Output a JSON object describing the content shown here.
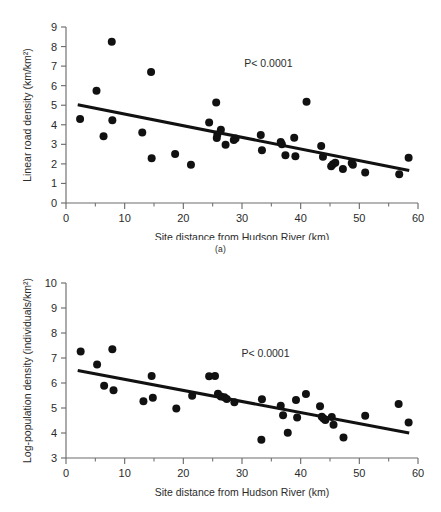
{
  "figure": {
    "panel_a_caption": "(a)",
    "background": "#ffffff",
    "marker_color": "#111111",
    "line_color": "#111111",
    "axis_color": "#6d6d6d"
  },
  "chart_data": [
    {
      "type": "scatter",
      "id": "panel-a",
      "title": "",
      "xlabel": "Site distance from Hudson River (km)",
      "ylabel": "Linear road density (km/km²)",
      "xlim": [
        0,
        60
      ],
      "ylim": [
        0,
        9
      ],
      "xticks": [
        0,
        10,
        20,
        30,
        40,
        50,
        60
      ],
      "xticklabels": [
        "0",
        "10",
        "20",
        "30",
        "40",
        "50",
        "60"
      ],
      "xminorticks": [
        5,
        15,
        25,
        35,
        45,
        55
      ],
      "yticks": [
        0,
        1,
        2,
        3,
        4,
        5,
        6,
        7,
        8,
        9
      ],
      "yticklabels": [
        "0",
        "1",
        "2",
        "3",
        "4",
        "5",
        "6",
        "7",
        "8",
        "9"
      ],
      "grid": false,
      "legend": null,
      "annotations": [
        {
          "text": "P< 0.0001",
          "x": 34.5,
          "y": 6.95
        }
      ],
      "trendline": {
        "x": [
          2.0,
          58.5
        ],
        "y": [
          5.02,
          1.66
        ]
      },
      "x": [
        2.4,
        5.2,
        6.4,
        7.8,
        7.9,
        13.0,
        14.5,
        14.6,
        18.6,
        21.3,
        24.4,
        25.6,
        25.7,
        25.8,
        26.4,
        27.2,
        28.6,
        28.9,
        33.2,
        33.4,
        36.6,
        36.8,
        37.4,
        38.9,
        39.1,
        41.0,
        43.5,
        43.8,
        45.2,
        45.5,
        45.9,
        47.2,
        48.7,
        48.9,
        51.0,
        56.8,
        58.4
      ],
      "y": [
        4.29,
        5.74,
        3.41,
        8.25,
        4.23,
        3.61,
        6.7,
        2.29,
        2.51,
        1.95,
        4.12,
        5.14,
        3.33,
        3.5,
        3.75,
        2.98,
        3.22,
        3.3,
        3.48,
        2.7,
        3.12,
        3.0,
        2.44,
        3.34,
        2.39,
        5.18,
        2.91,
        2.36,
        1.88,
        1.98,
        2.06,
        1.74,
        2.05,
        1.95,
        1.56,
        1.47,
        2.31
      ]
    },
    {
      "type": "scatter",
      "id": "panel-b",
      "title": "",
      "xlabel": "Site distance from Hudson River (km)",
      "ylabel": "Log-population density (individuals/km²)",
      "xlim": [
        0,
        60
      ],
      "ylim": [
        3,
        10
      ],
      "xticks": [
        0,
        10,
        20,
        30,
        40,
        50,
        60
      ],
      "xticklabels": [
        "0",
        "10",
        "20",
        "30",
        "40",
        "50",
        "60"
      ],
      "xminorticks": [
        5,
        15,
        25,
        35,
        45,
        55
      ],
      "yticks": [
        3,
        4,
        5,
        6,
        7,
        8,
        9,
        10
      ],
      "yticklabels": [
        "3",
        "4",
        "5",
        "6",
        "7",
        "8",
        "9",
        "10"
      ],
      "grid": false,
      "legend": null,
      "annotations": [
        {
          "text": "P< 0.0001",
          "x": 34.0,
          "y": 7.05
        }
      ],
      "trendline": {
        "x": [
          2.0,
          58.5
        ],
        "y": [
          6.5,
          4.0
        ]
      },
      "x": [
        2.5,
        5.3,
        6.5,
        7.9,
        8.1,
        13.2,
        14.6,
        14.8,
        18.8,
        21.5,
        24.4,
        25.4,
        25.9,
        26.4,
        27.0,
        27.4,
        28.7,
        33.3,
        33.4,
        36.6,
        37.0,
        37.8,
        39.2,
        39.4,
        40.9,
        43.3,
        43.6,
        43.9,
        44.2,
        45.3,
        45.6,
        47.3,
        51.0,
        56.7,
        58.4
      ],
      "y": [
        7.26,
        6.74,
        5.89,
        7.35,
        5.71,
        5.27,
        6.28,
        5.41,
        4.98,
        5.49,
        6.27,
        6.28,
        5.57,
        5.46,
        5.43,
        5.36,
        5.23,
        3.73,
        5.35,
        5.09,
        4.71,
        4.01,
        5.32,
        4.62,
        5.56,
        5.07,
        4.65,
        4.58,
        4.52,
        4.64,
        4.33,
        3.82,
        4.69,
        5.16,
        4.42
      ]
    }
  ]
}
